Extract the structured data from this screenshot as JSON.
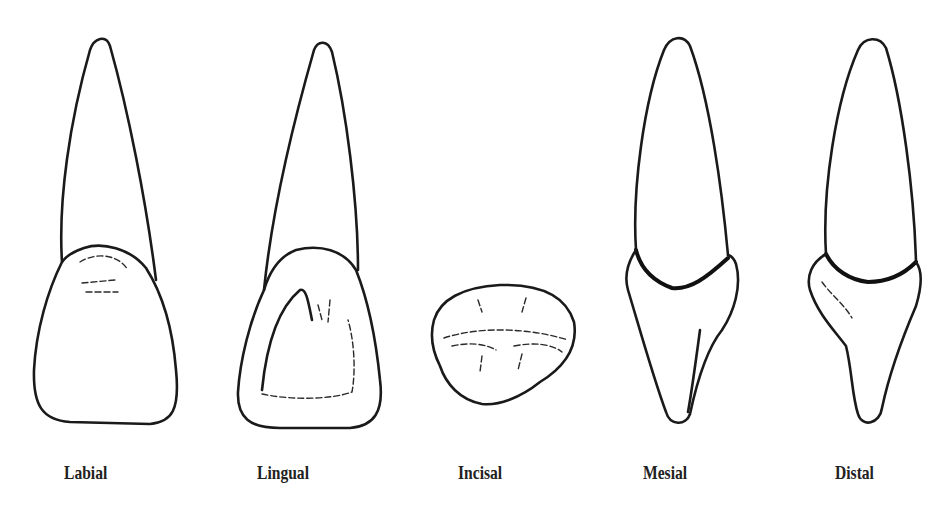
{
  "figure": {
    "caption_cutoff": "Fig. — Maxillary right central incisor views",
    "views": [
      {
        "id": "labial",
        "label": "Labial"
      },
      {
        "id": "lingual",
        "label": "Lingual"
      },
      {
        "id": "incisal",
        "label": "Incisal"
      },
      {
        "id": "mesial",
        "label": "Mesial"
      },
      {
        "id": "distal",
        "label": "Distal"
      }
    ],
    "colors": {
      "line": "#1a1a1a",
      "background": "#ffffff"
    }
  }
}
